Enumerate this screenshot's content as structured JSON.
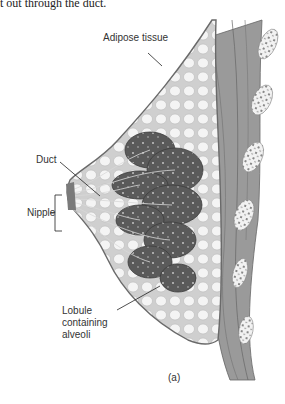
{
  "top_text": "t out through the duct.",
  "labels": {
    "adipose": "Adipose tissue",
    "duct": "Duct",
    "nipple": "Nipple",
    "lobule_line1": "Lobule",
    "lobule_line2": "containing",
    "lobule_line3": "alveoli"
  },
  "subfigure_label": "(a)",
  "colors": {
    "background": "#ffffff",
    "skin_outline": "#6a6a6a",
    "fat": "#d9d9d9",
    "lobule": "#5e5e5e",
    "muscle": "#8a8a8a",
    "rib": "#e8e8e8",
    "text": "#333333"
  }
}
